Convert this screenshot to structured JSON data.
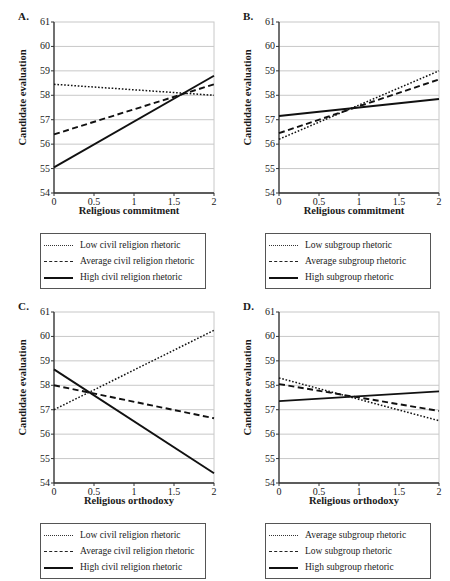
{
  "figure": {
    "panels": [
      {
        "letter": "A.",
        "xlabel": "Religious commitment",
        "ylabel": "Candidate evaluation",
        "legend": [
          {
            "style": "dotted",
            "label": "Low civil religion rhetoric"
          },
          {
            "style": "dashed",
            "label": "Average civil religion rhetoric"
          },
          {
            "style": "solid",
            "label": "High civil religion rhetoric"
          }
        ]
      },
      {
        "letter": "B.",
        "xlabel": "Religious commitment",
        "ylabel": "Candidate evaluation",
        "legend": [
          {
            "style": "dotted",
            "label": "Low subgroup rhetoric"
          },
          {
            "style": "dashed",
            "label": "Average subgroup rhetoric"
          },
          {
            "style": "solid",
            "label": "High subgroup rhetoric"
          }
        ]
      },
      {
        "letter": "C.",
        "xlabel": "Religious orthodoxy",
        "ylabel": "Candidate evaluation",
        "legend": [
          {
            "style": "dotted",
            "label": "Low civil religion rhetoric"
          },
          {
            "style": "dashed",
            "label": "Average civil religion rhetoric"
          },
          {
            "style": "solid",
            "label": "High civil religion rhetoric"
          }
        ]
      },
      {
        "letter": "D.",
        "xlabel": "Religious orthodoxy",
        "ylabel": "Candidate evaluation",
        "legend": [
          {
            "style": "dotted",
            "label": "Average subgroup rhetoric"
          },
          {
            "style": "dashed",
            "label": "Low subgroup rhetoric"
          },
          {
            "style": "solid",
            "label": "High subgroup rhetoric"
          }
        ]
      }
    ]
  },
  "chart_data": [
    {
      "panel": "A.",
      "type": "line",
      "title": "",
      "xlabel": "Religious commitment",
      "ylabel": "Candidate evaluation",
      "xlim": [
        0,
        2
      ],
      "ylim": [
        54,
        61
      ],
      "xticks": [
        0,
        0.5,
        1,
        1.5,
        2
      ],
      "xticklabels": [
        "0",
        "0.5",
        "1",
        "1.5",
        "2"
      ],
      "yticks": [
        54,
        55,
        56,
        57,
        58,
        59,
        60,
        61
      ],
      "yticklabels": [
        "54",
        "55",
        "56",
        "57",
        "58",
        "59",
        "60",
        "61"
      ],
      "grid": true,
      "legend_position": "below",
      "series": [
        {
          "name": "Low civil religion rhetoric",
          "style": "dotted",
          "x": [
            0,
            2
          ],
          "values": [
            58.45,
            58.0
          ]
        },
        {
          "name": "Average civil religion rhetoric",
          "style": "dashed",
          "x": [
            0,
            2
          ],
          "values": [
            56.4,
            58.45
          ]
        },
        {
          "name": "High civil religion rhetoric",
          "style": "solid",
          "x": [
            0,
            2
          ],
          "values": [
            55.05,
            58.8
          ]
        }
      ]
    },
    {
      "panel": "B.",
      "type": "line",
      "title": "",
      "xlabel": "Religious commitment",
      "ylabel": "Candidate evaluation",
      "xlim": [
        0,
        2
      ],
      "ylim": [
        54,
        61
      ],
      "xticks": [
        0,
        0.5,
        1,
        1.5,
        2
      ],
      "xticklabels": [
        "0",
        "0.5",
        "1",
        "1.5",
        "2"
      ],
      "yticks": [
        54,
        55,
        56,
        57,
        58,
        59,
        60,
        61
      ],
      "yticklabels": [
        "54",
        "55",
        "56",
        "57",
        "58",
        "59",
        "60",
        "61"
      ],
      "grid": true,
      "legend_position": "below",
      "series": [
        {
          "name": "Low subgroup rhetoric",
          "style": "dotted",
          "x": [
            0,
            2
          ],
          "values": [
            56.2,
            59.0
          ]
        },
        {
          "name": "Average subgroup rhetoric",
          "style": "dashed",
          "x": [
            0,
            2
          ],
          "values": [
            56.45,
            58.65
          ]
        },
        {
          "name": "High subgroup rhetoric",
          "style": "solid",
          "x": [
            0,
            2
          ],
          "values": [
            57.15,
            57.85
          ]
        }
      ]
    },
    {
      "panel": "C.",
      "type": "line",
      "title": "",
      "xlabel": "Religious orthodoxy",
      "ylabel": "Candidate evaluation",
      "xlim": [
        0,
        2
      ],
      "ylim": [
        54,
        61
      ],
      "xticks": [
        0,
        0.5,
        1,
        1.5,
        2
      ],
      "xticklabels": [
        "0",
        "0.5",
        "1",
        "1.5",
        "2"
      ],
      "yticks": [
        54,
        55,
        56,
        57,
        58,
        59,
        60,
        61
      ],
      "yticklabels": [
        "54",
        "55",
        "56",
        "57",
        "58",
        "59",
        "60",
        "61"
      ],
      "grid": true,
      "legend_position": "below",
      "series": [
        {
          "name": "Low civil religion rhetoric",
          "style": "dotted",
          "x": [
            0,
            2
          ],
          "values": [
            57.0,
            60.25
          ]
        },
        {
          "name": "Average civil religion rhetoric",
          "style": "dashed",
          "x": [
            0,
            2
          ],
          "values": [
            58.0,
            56.65
          ]
        },
        {
          "name": "High civil religion rhetoric",
          "style": "solid",
          "x": [
            0,
            2
          ],
          "values": [
            58.65,
            54.4
          ]
        }
      ]
    },
    {
      "panel": "D.",
      "type": "line",
      "title": "",
      "xlabel": "Religious orthodoxy",
      "ylabel": "Candidate evaluation",
      "xlim": [
        0,
        2
      ],
      "ylim": [
        54,
        61
      ],
      "xticks": [
        0,
        0.5,
        1,
        1.5,
        2
      ],
      "xticklabels": [
        "0",
        "0.5",
        "1",
        "1.5",
        "2"
      ],
      "yticks": [
        54,
        55,
        56,
        57,
        58,
        59,
        60,
        61
      ],
      "yticklabels": [
        "54",
        "55",
        "56",
        "57",
        "58",
        "59",
        "60",
        "61"
      ],
      "grid": true,
      "legend_position": "below",
      "series": [
        {
          "name": "Average subgroup rhetoric",
          "style": "dotted",
          "x": [
            0,
            2
          ],
          "values": [
            58.3,
            56.55
          ]
        },
        {
          "name": "Low subgroup rhetoric",
          "style": "dashed",
          "x": [
            0,
            2
          ],
          "values": [
            58.05,
            56.95
          ]
        },
        {
          "name": "High subgroup rhetoric",
          "style": "solid",
          "x": [
            0,
            2
          ],
          "values": [
            57.35,
            57.75
          ]
        }
      ]
    }
  ],
  "colors": {
    "axis": "#333333",
    "grid": "#c8c8c8",
    "line": "#111111",
    "legend_border": "#555555",
    "text": "#1a1a1a"
  }
}
